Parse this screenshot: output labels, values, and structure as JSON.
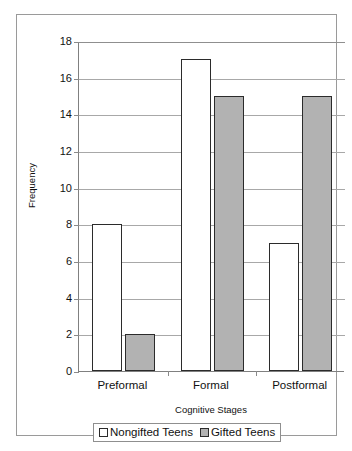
{
  "chart_data": {
    "type": "bar",
    "title": "",
    "xlabel": "Cognitive Stages",
    "ylabel": "Frequency",
    "categories": [
      "Preformal",
      "Formal",
      "Postformal"
    ],
    "series": [
      {
        "name": "Nongifted Teens",
        "values": [
          8,
          17,
          7
        ],
        "color": "#ffffff"
      },
      {
        "name": "Gifted Teens",
        "values": [
          2,
          15,
          15
        ],
        "color": "#b2b2b2"
      }
    ],
    "ylim": [
      0,
      18
    ],
    "ytick_step": 2,
    "yticks": [
      "0",
      "2",
      "4",
      "6",
      "8",
      "10",
      "12",
      "14",
      "16",
      "18"
    ],
    "grid": "horizontal",
    "legend_position": "bottom",
    "bar_border_color": "#2b2b2b",
    "gridline_color": "#a8a8a8",
    "axis_color": "#808080",
    "frame_color": "#9a9a9a"
  }
}
